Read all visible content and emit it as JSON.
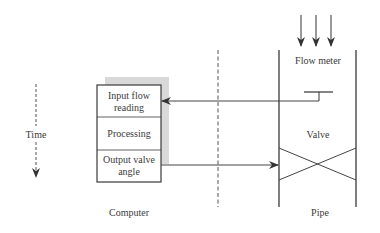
{
  "diagram": {
    "type": "flow-control-timing-diagram",
    "colors": {
      "line": "#4a4a4a",
      "shadow": "#d9d9d9",
      "text": "#3a3a3a",
      "background": "#ffffff"
    },
    "time_axis": {
      "label": "Time",
      "direction": "down",
      "style": "dashed"
    },
    "computer": {
      "label": "Computer",
      "steps": [
        {
          "line1": "Input flow",
          "line2": "reading"
        },
        {
          "line1": "Processing",
          "line2": ""
        },
        {
          "line1": "Output valve",
          "line2": "angle"
        }
      ]
    },
    "pipe": {
      "label": "Pipe",
      "flow_meter_label": "Flow meter",
      "valve_label": "Valve",
      "flow_arrows": 3
    },
    "connections": [
      {
        "from": "Flow meter",
        "to": "Input flow reading",
        "direction": "left"
      },
      {
        "from": "Output valve angle",
        "to": "Valve",
        "direction": "right"
      }
    ]
  }
}
